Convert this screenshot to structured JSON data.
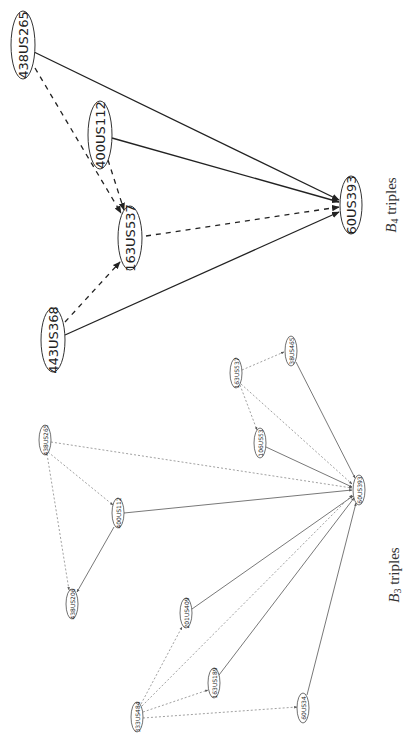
{
  "figure": {
    "b4": {
      "caption_main": "B",
      "caption_sub": "4",
      "caption_rest": " triples",
      "caption_pos": [
        391,
        205
      ],
      "nodes": [
        {
          "id": "438US265",
          "label": "438US265",
          "x": 23,
          "y": 45,
          "rx": 12,
          "ry": 34,
          "size": 13
        },
        {
          "id": "400US112",
          "label": "400US112",
          "x": 100,
          "y": 135,
          "rx": 12,
          "ry": 34,
          "size": 13
        },
        {
          "id": "163US537",
          "label": "163US537",
          "x": 130,
          "y": 238,
          "rx": 12,
          "ry": 32,
          "size": 13
        },
        {
          "id": "443US368",
          "label": "443US368",
          "x": 53,
          "y": 340,
          "rx": 12,
          "ry": 32,
          "size": 13
        },
        {
          "id": "60US393",
          "label": "60US393",
          "x": 351,
          "y": 205,
          "rx": 11,
          "ry": 29,
          "size": 13
        }
      ],
      "edges": [
        {
          "from": "438US265",
          "to": "60US393",
          "style": "solid",
          "x1": 34,
          "y1": 52,
          "x2": 339,
          "y2": 200
        },
        {
          "from": "400US112",
          "to": "60US393",
          "style": "solid",
          "x1": 112,
          "y1": 138,
          "x2": 339,
          "y2": 202
        },
        {
          "from": "443US368",
          "to": "60US393",
          "style": "solid",
          "x1": 65,
          "y1": 335,
          "x2": 339,
          "y2": 212
        },
        {
          "from": "163US537",
          "to": "60US393",
          "style": "dashed",
          "x1": 146,
          "y1": 236,
          "x2": 339,
          "y2": 207
        },
        {
          "from": "438US265",
          "to": "163US537",
          "style": "dashed",
          "x1": 35,
          "y1": 68,
          "x2": 121,
          "y2": 213
        },
        {
          "from": "400US112",
          "to": "163US537",
          "style": "dashed",
          "x1": 108,
          "y1": 160,
          "x2": 124,
          "y2": 210
        },
        {
          "from": "443US368",
          "to": "163US537",
          "style": "dashed",
          "x1": 65,
          "y1": 322,
          "x2": 120,
          "y2": 262
        }
      ]
    },
    "b3": {
      "caption_main": "B",
      "caption_sub": "3",
      "caption_rest": " triples",
      "caption_pos": [
        394,
        575
      ],
      "nodes": [
        {
          "id": "438US265b",
          "label": "438US265",
          "x": 45,
          "y": 440,
          "rx": 6,
          "ry": 15,
          "size": 6
        },
        {
          "id": "400US112b",
          "label": "400US112",
          "x": 118,
          "y": 513,
          "rx": 6,
          "ry": 15,
          "size": 6
        },
        {
          "id": "438US206",
          "label": "438US206",
          "x": 72,
          "y": 604,
          "rx": 6,
          "ry": 15,
          "size": 6
        },
        {
          "id": "163US537b",
          "label": "163US537",
          "x": 236,
          "y": 373,
          "rx": 6,
          "ry": 15,
          "size": 6
        },
        {
          "id": "38US465",
          "label": "38US465",
          "x": 291,
          "y": 351,
          "rx": 6,
          "ry": 15,
          "size": 6
        },
        {
          "id": "106US53",
          "label": "106US53",
          "x": 260,
          "y": 443,
          "rx": 6,
          "ry": 15,
          "size": 6
        },
        {
          "id": "60US393b",
          "label": "60US393",
          "x": 359,
          "y": 490,
          "rx": 6,
          "ry": 15,
          "size": 6
        },
        {
          "id": "201US409",
          "label": "201US409",
          "x": 186,
          "y": 613,
          "rx": 6,
          "ry": 15,
          "size": 6
        },
        {
          "id": "163US189",
          "label": "163US189",
          "x": 214,
          "y": 683,
          "rx": 6,
          "ry": 15,
          "size": 6
        },
        {
          "id": "333US484",
          "label": "333US484",
          "x": 137,
          "y": 717,
          "rx": 6,
          "ry": 15,
          "size": 6
        },
        {
          "id": "60US34",
          "label": "60US34",
          "x": 303,
          "y": 708,
          "rx": 6,
          "ry": 15,
          "size": 6
        }
      ],
      "edges": [
        {
          "style": "dotted",
          "x1": 51,
          "y1": 442,
          "x2": 352,
          "y2": 488
        },
        {
          "style": "dotted",
          "x1": 48,
          "y1": 452,
          "x2": 113,
          "y2": 505
        },
        {
          "style": "dotted",
          "x1": 47,
          "y1": 454,
          "x2": 69,
          "y2": 590
        },
        {
          "style": "solid",
          "x1": 124,
          "y1": 513,
          "x2": 352,
          "y2": 490
        },
        {
          "style": "solid",
          "x1": 114,
          "y1": 527,
          "x2": 77,
          "y2": 592
        },
        {
          "style": "dotted",
          "x1": 242,
          "y1": 370,
          "x2": 284,
          "y2": 352
        },
        {
          "style": "dotted",
          "x1": 240,
          "y1": 385,
          "x2": 257,
          "y2": 430
        },
        {
          "style": "dotted",
          "x1": 241,
          "y1": 384,
          "x2": 352,
          "y2": 484
        },
        {
          "style": "solid",
          "x1": 296,
          "y1": 362,
          "x2": 355,
          "y2": 478
        },
        {
          "style": "solid",
          "x1": 266,
          "y1": 447,
          "x2": 352,
          "y2": 487
        },
        {
          "style": "solid",
          "x1": 192,
          "y1": 609,
          "x2": 353,
          "y2": 496
        },
        {
          "style": "solid",
          "x1": 219,
          "y1": 675,
          "x2": 354,
          "y2": 498
        },
        {
          "style": "solid",
          "x1": 307,
          "y1": 695,
          "x2": 356,
          "y2": 503
        },
        {
          "style": "dotted",
          "x1": 141,
          "y1": 704,
          "x2": 182,
          "y2": 627
        },
        {
          "style": "dotted",
          "x1": 142,
          "y1": 706,
          "x2": 352,
          "y2": 495
        },
        {
          "style": "dotted",
          "x1": 143,
          "y1": 712,
          "x2": 208,
          "y2": 690
        },
        {
          "style": "dotted",
          "x1": 143,
          "y1": 718,
          "x2": 297,
          "y2": 707
        }
      ]
    }
  }
}
